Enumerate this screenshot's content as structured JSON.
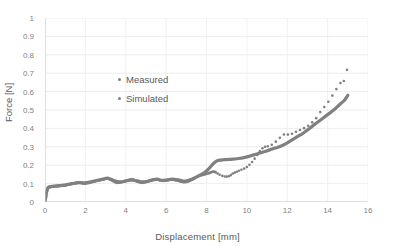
{
  "chart_data": {
    "type": "line",
    "title": "",
    "xlabel": "Displacement [mm]",
    "ylabel": "Force [N]",
    "xlim": [
      0,
      16
    ],
    "ylim": [
      0,
      1
    ],
    "xticks": [
      "0",
      "2",
      "4",
      "6",
      "8",
      "10",
      "12",
      "14",
      "16"
    ],
    "yticks": [
      "0",
      "0.1",
      "0.2",
      "0.3",
      "0.4",
      "0.5",
      "0.6",
      "0.7",
      "0.8",
      "0.9",
      "1"
    ],
    "grid": "horizontal-and-vertical",
    "legend_position": "inside-upper-left",
    "series_color": "#808080",
    "series": [
      {
        "name": "Measured",
        "style": "dotted-markers",
        "x": [
          0.0,
          0.05,
          0.1,
          0.15,
          0.2,
          0.3,
          0.45,
          0.6,
          0.8,
          1.0,
          1.2,
          1.45,
          1.7,
          1.95,
          2.2,
          2.45,
          2.7,
          2.95,
          3.1,
          3.3,
          3.55,
          3.8,
          4.05,
          4.3,
          4.55,
          4.8,
          5.05,
          5.3,
          5.55,
          5.8,
          6.05,
          6.3,
          6.6,
          6.9,
          7.1,
          7.35,
          7.6,
          7.9,
          8.15,
          8.35,
          8.5,
          8.65,
          8.85,
          9.0,
          9.15,
          9.3,
          9.45,
          9.6,
          9.8,
          10.0,
          10.2,
          10.45,
          10.7,
          10.9,
          11.1,
          11.3,
          11.5,
          11.7,
          11.9,
          12.1,
          12.3,
          12.5,
          12.7,
          12.9,
          13.1,
          13.3,
          13.5,
          13.7,
          13.9,
          14.1,
          14.3,
          14.5,
          14.7,
          14.85,
          15.0
        ],
        "y": [
          0.0,
          0.03,
          0.06,
          0.075,
          0.08,
          0.082,
          0.085,
          0.086,
          0.088,
          0.09,
          0.095,
          0.1,
          0.105,
          0.1,
          0.105,
          0.112,
          0.118,
          0.125,
          0.128,
          0.118,
          0.105,
          0.108,
          0.115,
          0.122,
          0.112,
          0.105,
          0.11,
          0.118,
          0.122,
          0.115,
          0.118,
          0.122,
          0.115,
          0.108,
          0.112,
          0.125,
          0.14,
          0.15,
          0.158,
          0.165,
          0.158,
          0.148,
          0.14,
          0.138,
          0.142,
          0.155,
          0.162,
          0.17,
          0.178,
          0.19,
          0.21,
          0.245,
          0.285,
          0.3,
          0.305,
          0.315,
          0.335,
          0.355,
          0.37,
          0.365,
          0.375,
          0.385,
          0.395,
          0.405,
          0.42,
          0.44,
          0.465,
          0.5,
          0.525,
          0.555,
          0.59,
          0.625,
          0.655,
          0.665,
          0.74
        ]
      },
      {
        "name": "Simulated",
        "style": "thick-solid-line",
        "x": [
          0.0,
          0.05,
          0.1,
          0.15,
          0.2,
          0.3,
          0.45,
          0.6,
          0.8,
          1.0,
          1.2,
          1.45,
          1.7,
          1.95,
          2.2,
          2.45,
          2.7,
          2.95,
          3.1,
          3.3,
          3.55,
          3.8,
          4.05,
          4.3,
          4.55,
          4.8,
          5.05,
          5.3,
          5.55,
          5.8,
          6.05,
          6.3,
          6.6,
          6.9,
          7.1,
          7.35,
          7.6,
          7.9,
          8.15,
          8.35,
          8.55,
          8.7,
          8.9,
          9.2,
          9.5,
          9.8,
          10.1,
          10.4,
          10.7,
          11.0,
          11.3,
          11.6,
          11.9,
          12.2,
          12.5,
          12.8,
          13.1,
          13.4,
          13.7,
          14.0,
          14.3,
          14.6,
          14.85,
          15.0
        ],
        "y": [
          0.0,
          0.035,
          0.065,
          0.078,
          0.082,
          0.084,
          0.086,
          0.088,
          0.09,
          0.093,
          0.098,
          0.102,
          0.106,
          0.104,
          0.108,
          0.114,
          0.12,
          0.126,
          0.13,
          0.122,
          0.112,
          0.11,
          0.116,
          0.12,
          0.115,
          0.11,
          0.112,
          0.12,
          0.124,
          0.118,
          0.12,
          0.124,
          0.12,
          0.114,
          0.118,
          0.128,
          0.142,
          0.16,
          0.185,
          0.21,
          0.225,
          0.228,
          0.23,
          0.232,
          0.235,
          0.24,
          0.248,
          0.258,
          0.268,
          0.278,
          0.29,
          0.3,
          0.315,
          0.335,
          0.355,
          0.375,
          0.4,
          0.425,
          0.45,
          0.475,
          0.5,
          0.53,
          0.555,
          0.58
        ]
      }
    ]
  },
  "legend": {
    "items": [
      {
        "label": "Measured"
      },
      {
        "label": "Simulated"
      }
    ]
  }
}
